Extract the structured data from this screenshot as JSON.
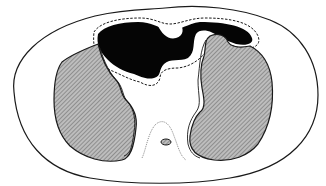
{
  "diagram": {
    "type": "axial cross-section illustration",
    "labels": [],
    "colors": {
      "background": "#ffffff",
      "outline": "#1a1a1a",
      "lung_fill": "#a8a8a8",
      "dark_region": "#050505",
      "body_fill": "#ffffff"
    },
    "regions": [
      {
        "id": "body-outline",
        "description": "outer body contour (oval)"
      },
      {
        "id": "left-lung",
        "description": "hatched gray lung on image left"
      },
      {
        "id": "right-lung",
        "description": "hatched gray lung on image right"
      },
      {
        "id": "dark-anterior-region",
        "description": "black anterior region bordered by dashed line"
      },
      {
        "id": "mediastinum",
        "description": "white central region"
      },
      {
        "id": "posterior-recess",
        "description": "dotted thin outline between lungs posteriorly"
      },
      {
        "id": "small-oval",
        "description": "small hatched oval near posterior midline"
      }
    ]
  }
}
